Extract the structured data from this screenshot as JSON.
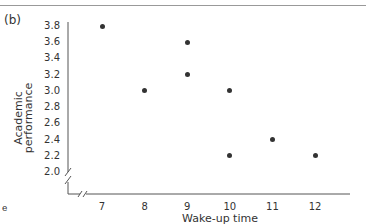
{
  "panel_label": "(b)",
  "corner_mark": "e",
  "chart_data": {
    "type": "scatter",
    "title": "",
    "xlabel": "Wake-up time",
    "ylabel": "Academic performance",
    "x_ticks": [
      "7",
      "8",
      "9",
      "10",
      "11",
      "12"
    ],
    "y_ticks": [
      "3.8",
      "3.6",
      "3.4",
      "3.2",
      "3.0",
      "2.8",
      "2.6",
      "2.4",
      "2.2",
      "2.0"
    ],
    "xlim": [
      7,
      12
    ],
    "ylim": [
      2.0,
      3.8
    ],
    "axis_breaks": true,
    "grid": false,
    "points": [
      {
        "x": 7,
        "y": 3.8
      },
      {
        "x": 8,
        "y": 3.0
      },
      {
        "x": 9,
        "y": 3.6
      },
      {
        "x": 9,
        "y": 3.2
      },
      {
        "x": 10,
        "y": 3.0
      },
      {
        "x": 10,
        "y": 2.2
      },
      {
        "x": 11,
        "y": 2.4
      },
      {
        "x": 12,
        "y": 2.2
      }
    ]
  }
}
